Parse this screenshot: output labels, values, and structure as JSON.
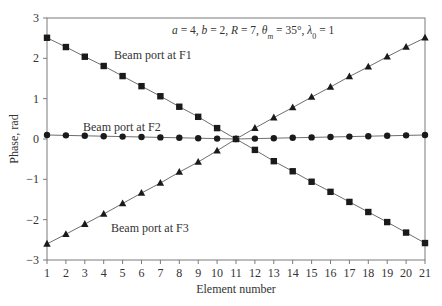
{
  "chart_data": {
    "type": "line",
    "title": "",
    "annotation": {
      "parts": [
        {
          "text": "a",
          "italic": true
        },
        {
          "text": " = 4, ",
          "italic": false
        },
        {
          "text": "b",
          "italic": true
        },
        {
          "text": " = 2, ",
          "italic": false
        },
        {
          "text": "R",
          "italic": true
        },
        {
          "text": " = 7, ",
          "italic": false
        },
        {
          "text": "θ",
          "italic": true
        },
        {
          "text": "m",
          "italic": true,
          "sub": true
        },
        {
          "text": " = 35°, ",
          "italic": false
        },
        {
          "text": "λ",
          "italic": true
        },
        {
          "text": "0",
          "italic": false,
          "sub": true
        },
        {
          "text": " = 1",
          "italic": false
        }
      ]
    },
    "xlabel": "Element number",
    "ylabel": "Phase, rad",
    "xlim": [
      1,
      21
    ],
    "ylim": [
      -3,
      3
    ],
    "xticks": [
      1,
      2,
      3,
      4,
      5,
      6,
      7,
      8,
      9,
      10,
      11,
      12,
      13,
      14,
      15,
      16,
      17,
      18,
      19,
      20,
      21
    ],
    "yticks": [
      -3,
      -2,
      -1,
      0,
      1,
      2,
      3
    ],
    "ytick_labels": [
      "−3",
      "−2",
      "−1",
      "0",
      "1",
      "2",
      "3"
    ],
    "grid": false,
    "legend": "inline labels",
    "x": [
      1,
      2,
      3,
      4,
      5,
      6,
      7,
      8,
      9,
      10,
      11,
      12,
      13,
      14,
      15,
      16,
      17,
      18,
      19,
      20,
      21
    ],
    "series": [
      {
        "name": "Beam port at F1",
        "marker": "square",
        "label_pos": {
          "x": 114,
          "y": 59
        },
        "values": [
          2.51,
          2.28,
          2.04,
          1.81,
          1.56,
          1.31,
          1.06,
          0.8,
          0.55,
          0.27,
          0.0,
          -0.27,
          -0.55,
          -0.8,
          -1.06,
          -1.31,
          -1.56,
          -1.81,
          -2.06,
          -2.32,
          -2.58
        ]
      },
      {
        "name": "Beam port at F2",
        "marker": "circle",
        "label_pos": {
          "x": 83,
          "y": 131
        },
        "values": [
          0.1,
          0.09,
          0.08,
          0.07,
          0.06,
          0.05,
          0.04,
          0.03,
          0.02,
          0.01,
          0.0,
          0.01,
          0.02,
          0.03,
          0.04,
          0.05,
          0.06,
          0.07,
          0.08,
          0.09,
          0.1
        ]
      },
      {
        "name": "Beam port at F3",
        "marker": "triangle",
        "label_pos": {
          "x": 111,
          "y": 232
        },
        "values": [
          -2.6,
          -2.36,
          -2.11,
          -1.86,
          -1.6,
          -1.34,
          -1.09,
          -0.82,
          -0.57,
          -0.29,
          0.0,
          0.27,
          0.53,
          0.78,
          1.04,
          1.29,
          1.55,
          1.79,
          2.04,
          2.28,
          2.51
        ]
      }
    ]
  },
  "colors": {
    "axis": "#7a7a7a",
    "line": "#6e6e6e",
    "marker": "#1a1a1a",
    "text": "#333333"
  }
}
